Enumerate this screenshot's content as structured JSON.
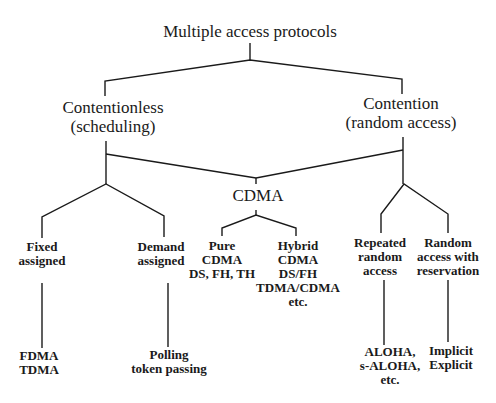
{
  "diagram": {
    "root": {
      "label": "Multiple access protocols"
    },
    "contentionless": {
      "lines": [
        "Contentionless",
        "(scheduling)"
      ]
    },
    "contention": {
      "lines": [
        "Contention",
        "(random access)"
      ]
    },
    "cdma": {
      "label": "CDMA"
    },
    "fixed_assigned": {
      "lines": [
        "Fixed",
        "assigned"
      ]
    },
    "demand_assigned": {
      "lines": [
        "Demand",
        "assigned"
      ]
    },
    "pure_cdma": {
      "lines": [
        "Pure",
        "CDMA",
        "DS, FH, TH"
      ]
    },
    "hybrid_cdma": {
      "lines": [
        "Hybrid",
        "CDMA",
        "DS/FH",
        "TDMA/CDMA",
        "etc."
      ]
    },
    "repeated_random": {
      "lines": [
        "Repeated",
        "random",
        "access"
      ]
    },
    "random_reservation": {
      "lines": [
        "Random",
        "access with",
        "reservation"
      ]
    },
    "fdma_tdma": {
      "lines": [
        "FDMA",
        "TDMA"
      ]
    },
    "polling": {
      "lines": [
        "Polling",
        "token passing"
      ]
    },
    "aloha": {
      "lines": [
        "ALOHA,",
        "s-ALOHA,",
        "etc."
      ]
    },
    "implicit_explicit": {
      "lines": [
        "Implicit",
        "Explicit"
      ]
    }
  }
}
